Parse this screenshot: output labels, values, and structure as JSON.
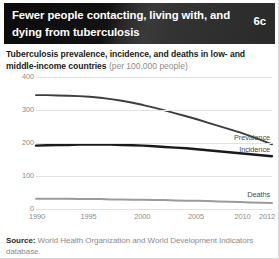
{
  "header": {
    "title": "Fewer people contacting, living with, and dying from tuberculosis",
    "badge": "6c"
  },
  "subtitle": {
    "main": "Tuberculosis prevalence, incidence, and deaths in low- and middle-income countries ",
    "unit": "(per 100,000 people)"
  },
  "footer": {
    "source_label": "Source:",
    "source_text": " World Health Organization and World Development Indicators database."
  },
  "colors": {
    "header_background": "#1c1c1c",
    "header_text": "#ffffff",
    "prevalence_line": "#3d3d3d",
    "incidence_line": "#1a1a1a",
    "deaths_line": "#9b9b9b",
    "gridline": "#e2e2e2",
    "tick_text": "#8c8c8c"
  },
  "chart_data": {
    "type": "line",
    "title": "Tuberculosis prevalence, incidence, and deaths in low- and middle-income countries (per 100,000 people)",
    "xlabel": "",
    "ylabel": "",
    "ylim": [
      0,
      400
    ],
    "xlim": [
      1990,
      2012
    ],
    "grid": true,
    "legend_position": "inline-right",
    "yticks": [
      "400",
      "300",
      "200",
      "100",
      "0"
    ],
    "ytick_values": [
      400,
      300,
      200,
      100,
      0
    ],
    "xticks": [
      "1990",
      "1995",
      "2000",
      "2005",
      "2010",
      "2012"
    ],
    "xtick_values": [
      1990,
      1995,
      2000,
      2005,
      2010,
      2012
    ],
    "x": [
      1990,
      1991,
      1992,
      1993,
      1994,
      1995,
      1996,
      1997,
      1998,
      1999,
      2000,
      2001,
      2002,
      2003,
      2004,
      2005,
      2006,
      2007,
      2008,
      2009,
      2010,
      2011,
      2012
    ],
    "series": [
      {
        "name": "Prevalence",
        "values": [
          345,
          345,
          344,
          343,
          342,
          340,
          337,
          333,
          328,
          322,
          315,
          307,
          299,
          290,
          281,
          272,
          262,
          252,
          242,
          232,
          221,
          209,
          196
        ]
      },
      {
        "name": "Incidence",
        "values": [
          192,
          193,
          194,
          194,
          195,
          195,
          195,
          195,
          194,
          193,
          192,
          190,
          188,
          186,
          184,
          181,
          178,
          175,
          172,
          169,
          166,
          163,
          160
        ]
      },
      {
        "name": "Deaths",
        "values": [
          31,
          31,
          31,
          31,
          30,
          30,
          30,
          29,
          29,
          28,
          28,
          27,
          27,
          26,
          25,
          25,
          24,
          23,
          22,
          21,
          20,
          19,
          18
        ]
      }
    ]
  }
}
